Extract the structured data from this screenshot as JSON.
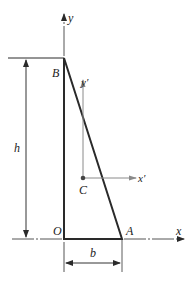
{
  "figure": {
    "labels": {
      "y_axis": "y",
      "x_axis": "x",
      "y_prime": "y′",
      "x_prime": "x′",
      "point_B": "B",
      "point_O": "O",
      "point_A": "A",
      "point_C": "C",
      "height": "h",
      "base": "b"
    },
    "colors": {
      "outline": "#2a2a2a",
      "axis": "#555555",
      "centroid_axes": "#8a8a8a",
      "dimension": "#333333"
    }
  }
}
